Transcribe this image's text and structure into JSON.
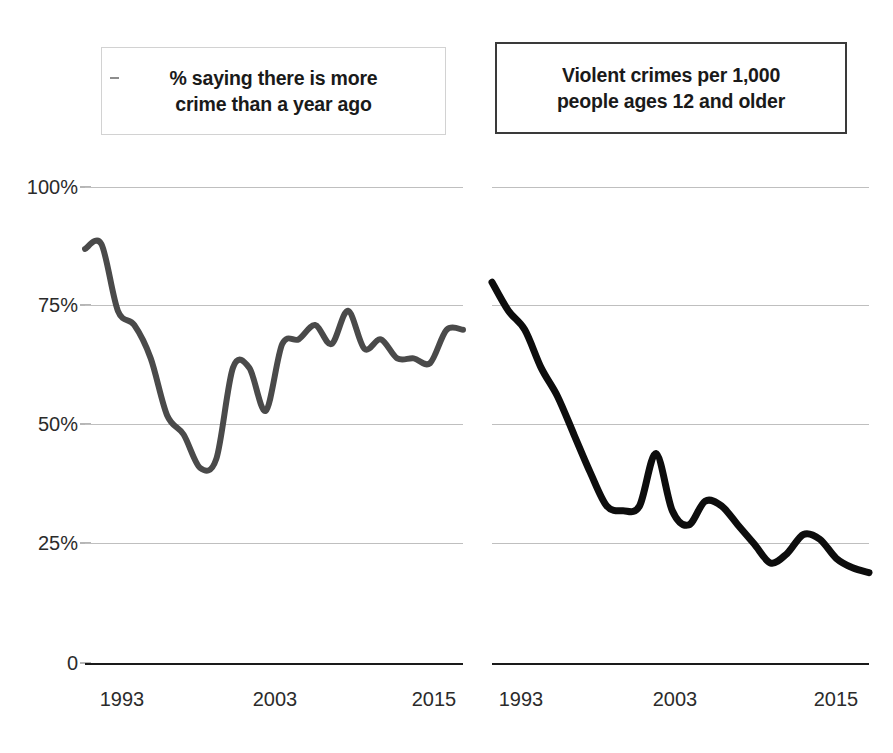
{
  "panels": {
    "left": {
      "title": "% saying there is more\ncrime than a year ago",
      "dash_icon": "dash-icon"
    },
    "right": {
      "title": "Violent crimes per 1,000\npeople ages 12 and older"
    }
  },
  "axis": {
    "y_ticks": [
      "100%",
      "75%",
      "50%",
      "25%",
      "0"
    ],
    "x_ticks": [
      "1993",
      "2003",
      "2015"
    ]
  },
  "colors": {
    "line_left": "#4a4a4a",
    "line_right": "#0d0d0d",
    "gridline": "#bfbfbf",
    "baseline": "#1a1a1a",
    "title_border_left": "#d2d2d2",
    "title_border_right": "#3a3a3a",
    "text": "#1a1a1a"
  },
  "chart_data": [
    {
      "type": "line",
      "title": "% saying there is more crime than a year ago",
      "xlabel": "",
      "ylabel": "",
      "ylim": [
        0,
        100
      ],
      "xlim": [
        1993,
        2016
      ],
      "grid": true,
      "legend": "none",
      "y_tick_values": [
        0,
        25,
        50,
        75,
        100
      ],
      "x_tick_values": [
        1993,
        2003,
        2015
      ],
      "x": [
        1993,
        1994,
        1995,
        1996,
        1997,
        1998,
        1999,
        2000,
        2001,
        2002,
        2003,
        2004,
        2005,
        2006,
        2007,
        2008,
        2009,
        2010,
        2011,
        2012,
        2013,
        2014,
        2015,
        2016
      ],
      "values": [
        87,
        88,
        74,
        71,
        64,
        52,
        48,
        41,
        43,
        62,
        62,
        53,
        67,
        68,
        71,
        67,
        74,
        66,
        68,
        64,
        64,
        63,
        70,
        70
      ]
    },
    {
      "type": "line",
      "title": "Violent crimes per 1,000 people ages 12 and older",
      "xlabel": "",
      "ylabel": "",
      "ylim": [
        0,
        100
      ],
      "xlim": [
        1993,
        2016
      ],
      "grid": true,
      "legend": "none",
      "y_tick_values": [
        0,
        25,
        50,
        75,
        100
      ],
      "x_tick_values": [
        1993,
        2003,
        2015
      ],
      "x": [
        1993,
        1994,
        1995,
        1996,
        1997,
        1998,
        1999,
        2000,
        2001,
        2002,
        2003,
        2004,
        2005,
        2006,
        2007,
        2008,
        2009,
        2010,
        2011,
        2012,
        2013,
        2014,
        2015,
        2016
      ],
      "values": [
        80,
        74,
        70,
        62,
        56,
        48,
        40,
        33,
        32,
        33,
        44,
        32,
        29,
        34,
        33,
        29,
        25,
        21,
        23,
        27,
        26,
        22,
        20,
        19
      ]
    }
  ]
}
